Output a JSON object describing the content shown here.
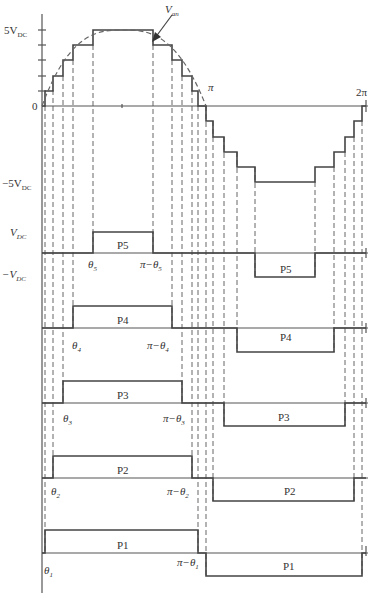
{
  "diagram": {
    "top_plot": {
      "y_labels": {
        "positive": "5V",
        "positive_sub": "DC",
        "zero": "0",
        "negative": "−5V",
        "negative_sub": "DC"
      },
      "x_labels": {
        "pi": "π",
        "two_pi": "2π"
      },
      "curve_label": "V",
      "curve_label_sub": "an"
    },
    "level_labels": {
      "vdc": "V",
      "vdc_sub": "DC",
      "neg_vdc": "−V",
      "neg_vdc_sub": "DC"
    },
    "pulses": [
      {
        "name": "P5",
        "angle": "θ",
        "angle_sub": "5",
        "complement": "π−θ",
        "complement_sub": "5"
      },
      {
        "name": "P4",
        "angle": "θ",
        "angle_sub": "4",
        "complement": "π−θ",
        "complement_sub": "4"
      },
      {
        "name": "P3",
        "angle": "θ",
        "angle_sub": "3",
        "complement": "π−θ",
        "complement_sub": "3"
      },
      {
        "name": "P2",
        "angle": "θ",
        "angle_sub": "2",
        "complement": "π−θ",
        "complement_sub": "2"
      },
      {
        "name": "P1",
        "angle": "θ",
        "angle_sub": "1",
        "complement": "π−θ",
        "complement_sub": "1"
      }
    ]
  }
}
